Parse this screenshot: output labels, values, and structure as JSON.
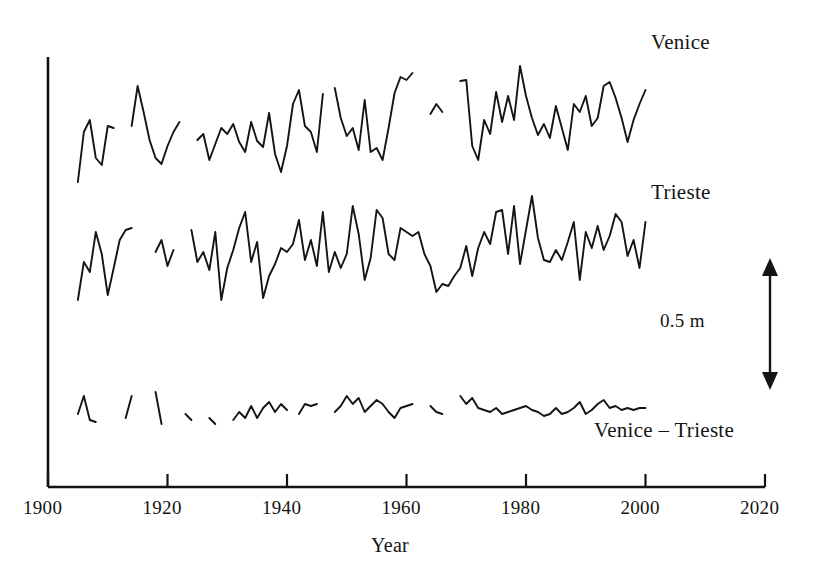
{
  "figure": {
    "width": 818,
    "height": 581,
    "background": "#ffffff",
    "line_color": "#141414",
    "axis_color": "#141414"
  },
  "labels": {
    "venice": "Venice",
    "trieste": "Trieste",
    "difference": "Venice – Trieste",
    "scale_bar": "0.5 m",
    "xaxis_title": "Year"
  },
  "axis": {
    "x_ticks": [
      "1900",
      "1920",
      "1940",
      "1960",
      "1980",
      "2000",
      "2020"
    ],
    "x_tick_values": [
      1900,
      1920,
      1940,
      1960,
      1980,
      2000,
      2020
    ],
    "x_min": 1900,
    "x_max": 2020,
    "y_axis_visible": true,
    "y_ticks": [],
    "grid": false
  },
  "scale_bar": {
    "label": "0.5 m",
    "length_label": "0.5",
    "unit": "m",
    "arrow": "double-headed-vertical"
  },
  "chart_data": {
    "type": "line",
    "title": "",
    "subtitle": "",
    "xlabel": "Year",
    "ylabel": "",
    "xlim": [
      1900,
      2020
    ],
    "ylim": [
      0,
      1
    ],
    "grid": false,
    "legend": "inline-right-labels",
    "annotations": [
      {
        "text": "Venice",
        "x": 2003,
        "y_px": 40
      },
      {
        "text": "Trieste",
        "x": 2003,
        "y_px": 190
      },
      {
        "text": "Venice – Trieste",
        "x": 1992,
        "y_px": 428
      },
      {
        "text": "0.5 m",
        "x": 2004,
        "y_px": 320
      }
    ],
    "vertical_units": "metres (relative sea level, offset per series)",
    "vertical_scale_px_per_half_metre": 130,
    "series": [
      {
        "name": "Venice",
        "baseline_px": 130,
        "note": "annual mean relative sea level, gaps where data missing",
        "segments": [
          {
            "x": [
              1905,
              1906,
              1907,
              1908,
              1909,
              1910,
              1911
            ],
            "y_px": [
              182,
              132,
              120,
              158,
              165,
              126,
              128
            ]
          },
          {
            "x": [
              1914,
              1915,
              1916,
              1917,
              1918,
              1919,
              1920,
              1921,
              1922
            ],
            "y_px": [
              126,
              86,
              112,
              140,
              158,
              164,
              146,
              132,
              122
            ]
          },
          {
            "x": [
              1925,
              1926,
              1927,
              1928,
              1929,
              1930,
              1931,
              1932,
              1933,
              1934,
              1935,
              1936,
              1937,
              1938,
              1939,
              1940,
              1941,
              1942,
              1943,
              1944,
              1945,
              1946
            ],
            "y_px": [
              140,
              134,
              160,
              144,
              128,
              134,
              124,
              142,
              152,
              122,
              141,
              147,
              113,
              154,
              172,
              146,
              104,
              90,
              126,
              132,
              152,
              94
            ]
          },
          {
            "x": [
              1948,
              1949,
              1950,
              1951,
              1952,
              1953,
              1954,
              1955,
              1956,
              1957,
              1958,
              1959,
              1960,
              1961
            ],
            "y_px": [
              88,
              118,
              136,
              128,
              150,
              100,
              152,
              148,
              160,
              128,
              93,
              77,
              80,
              73
            ]
          },
          {
            "x": [
              1964,
              1965,
              1966
            ],
            "y_px": [
              114,
              104,
              112
            ]
          },
          {
            "x": [
              1969,
              1970,
              1971,
              1972,
              1973,
              1974,
              1975,
              1976,
              1977,
              1978,
              1979,
              1980,
              1981,
              1982,
              1983,
              1984,
              1985,
              1986,
              1987,
              1988,
              1989,
              1990,
              1991,
              1992,
              1993,
              1994,
              1995,
              1996,
              1997,
              1998,
              1999,
              2000
            ],
            "y_px": [
              81,
              80,
              146,
              160,
              120,
              134,
              92,
              122,
              96,
              120,
              66,
              96,
              118,
              135,
              124,
              138,
              106,
              128,
              150,
              104,
              112,
              96,
              126,
              118,
              86,
              82,
              98,
              118,
              142,
              120,
              104,
              90
            ]
          }
        ]
      },
      {
        "name": "Trieste",
        "baseline_px": 265,
        "note": "annual mean relative sea level, gaps where data missing",
        "segments": [
          {
            "x": [
              1905,
              1906,
              1907,
              1908,
              1909,
              1910,
              1911,
              1912,
              1913,
              1914
            ],
            "y_px": [
              300,
              262,
              272,
              232,
              254,
              295,
              268,
              240,
              230,
              228
            ]
          },
          {
            "x": [
              1918,
              1919,
              1920,
              1921
            ],
            "y_px": [
              252,
              240,
              266,
              250
            ]
          },
          {
            "x": [
              1924,
              1925,
              1926,
              1927,
              1928,
              1929,
              1930,
              1931,
              1932,
              1933,
              1934,
              1935,
              1936,
              1937,
              1938,
              1939,
              1940,
              1941,
              1942,
              1943,
              1944,
              1945,
              1946,
              1947,
              1948,
              1949,
              1950,
              1951,
              1952,
              1953,
              1954,
              1955,
              1956,
              1957,
              1958,
              1959,
              1960,
              1961,
              1962,
              1963,
              1964,
              1965,
              1966,
              1967,
              1968,
              1969,
              1970,
              1971,
              1972,
              1973,
              1974,
              1975,
              1976,
              1977,
              1978,
              1979,
              1980,
              1981,
              1982,
              1983,
              1984,
              1985,
              1986,
              1987,
              1988,
              1989,
              1990,
              1991,
              1992,
              1993,
              1994,
              1995,
              1996,
              1997,
              1998,
              1999,
              2000
            ],
            "y_px": [
              230,
              262,
              252,
              270,
              232,
              300,
              268,
              250,
              228,
              212,
              262,
              242,
              298,
              276,
              264,
              248,
              252,
              244,
              220,
              260,
              240,
              266,
              212,
              272,
              252,
              268,
              254,
              206,
              234,
              280,
              258,
              210,
              218,
              254,
              260,
              228,
              232,
              236,
              232,
              254,
              266,
              292,
              284,
              286,
              276,
              268,
              246,
              276,
              248,
              232,
              244,
              212,
              210,
              254,
              206,
              264,
              230,
              196,
              238,
              260,
              262,
              250,
              260,
              242,
              222,
              280,
              232,
              248,
              226,
              250,
              236,
              214,
              222,
              256,
              240,
              268,
              222
            ]
          }
        ]
      },
      {
        "name": "Venice – Trieste",
        "baseline_px": 410,
        "note": "difference series, many gaps before 1940",
        "segments": [
          {
            "x": [
              1905,
              1906,
              1907,
              1908
            ],
            "y_px": [
              414,
              396,
              420,
              422
            ]
          },
          {
            "x": [
              1913,
              1914
            ],
            "y_px": [
              418,
              396
            ]
          },
          {
            "x": [
              1918,
              1919
            ],
            "y_px": [
              392,
              424
            ]
          },
          {
            "x": [
              1923,
              1924
            ],
            "y_px": [
              414,
              420
            ]
          },
          {
            "x": [
              1927,
              1928
            ],
            "y_px": [
              418,
              424
            ]
          },
          {
            "x": [
              1931,
              1932,
              1933,
              1934,
              1935,
              1936,
              1937,
              1938,
              1939,
              1940
            ],
            "y_px": [
              420,
              412,
              418,
              406,
              418,
              408,
              402,
              412,
              404,
              410
            ]
          },
          {
            "x": [
              1942,
              1943,
              1944,
              1945
            ],
            "y_px": [
              414,
              404,
              406,
              404
            ]
          },
          {
            "x": [
              1948,
              1949,
              1950,
              1951,
              1952,
              1953,
              1954,
              1955,
              1956,
              1957,
              1958,
              1959,
              1960,
              1961
            ],
            "y_px": [
              412,
              406,
              396,
              404,
              398,
              412,
              406,
              400,
              404,
              412,
              418,
              408,
              406,
              404
            ]
          },
          {
            "x": [
              1964,
              1965,
              1966
            ],
            "y_px": [
              406,
              412,
              414
            ]
          },
          {
            "x": [
              1969,
              1970,
              1971,
              1972,
              1973,
              1974,
              1975,
              1976,
              1977,
              1978,
              1979,
              1980,
              1981,
              1982,
              1983,
              1984,
              1985,
              1986,
              1987,
              1988,
              1989,
              1990,
              1991,
              1992,
              1993,
              1994,
              1995,
              1996,
              1997,
              1998,
              1999,
              2000
            ],
            "y_px": [
              396,
              404,
              398,
              408,
              410,
              412,
              408,
              414,
              412,
              410,
              408,
              406,
              410,
              412,
              416,
              414,
              408,
              414,
              412,
              408,
              402,
              414,
              410,
              404,
              400,
              408,
              406,
              410,
              408,
              410,
              408,
              408
            ]
          }
        ]
      }
    ]
  }
}
